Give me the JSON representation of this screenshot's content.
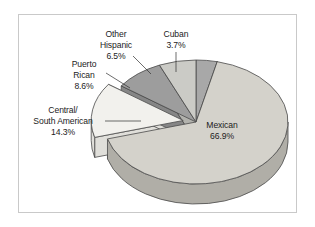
{
  "figure": {
    "background_color": "#ffffff",
    "frame_color": "#c9c9c9",
    "label_color": "#1c1c1c",
    "outline_color": "#4a4a4a"
  },
  "chart_data": {
    "type": "pie",
    "title": "",
    "subtitle": "",
    "xlabel": "",
    "ylabel": "",
    "style": "3d-exploded",
    "legend_position": "none",
    "grid": false,
    "start_angle_deg": 0,
    "direction": "clockwise",
    "categories": [
      "Mexican",
      "Central/South American",
      "Puerto Rican",
      "Other Hispanic",
      "Cuban"
    ],
    "values": [
      66.9,
      14.3,
      8.6,
      6.5,
      3.7
    ],
    "value_unit": "%",
    "slices": [
      {
        "name": "Cuban",
        "label_line1": "Cuban",
        "label_line2": "3.7%",
        "value": 3.7,
        "color": "#a8a8a8",
        "side_color": "#8e8e8e",
        "exploded": false,
        "leader": "vertical"
      },
      {
        "name": "Mexican",
        "label_line1": "Mexican",
        "label_line2": "66.9%",
        "value": 66.9,
        "color": "#d4d2cb",
        "side_color": "#b0aea7",
        "exploded": false,
        "leader": "none"
      },
      {
        "name": "Central/South American",
        "label_line1": "Central/",
        "label_line2": "South American",
        "label_line3": "14.3%",
        "value": 14.3,
        "color": "#f2f1ed",
        "side_color": "#e0dfda",
        "exploded": true,
        "leader": "horizontal"
      },
      {
        "name": "Puerto Rican",
        "label_line1": "Puerto",
        "label_line2": "Rican",
        "label_line3": "8.6%",
        "value": 8.6,
        "color": "#9d9d9d",
        "side_color": "#868686",
        "exploded": false,
        "leader": "diagonal"
      },
      {
        "name": "Other Hispanic",
        "label_line1": "Other",
        "label_line2": "Hispanic",
        "label_line3": "6.5%",
        "value": 6.5,
        "color": "#cbcbc6",
        "side_color": "#b2b2ad",
        "exploded": false,
        "leader": "diagonal"
      }
    ]
  }
}
